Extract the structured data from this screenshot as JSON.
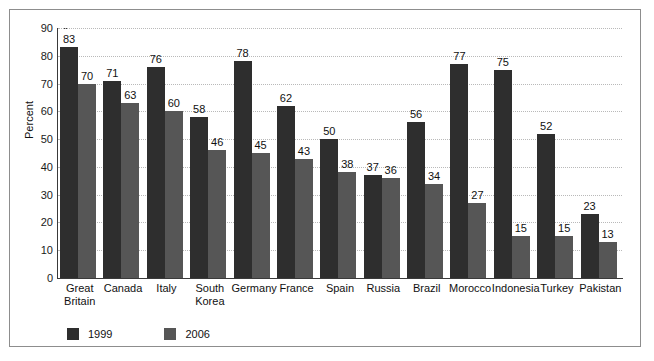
{
  "chart_data": {
    "type": "bar",
    "title": "",
    "xlabel": "",
    "ylabel": "Percent",
    "ylim": [
      0,
      90
    ],
    "ytick_step": 10,
    "yticks": [
      90,
      80,
      70,
      60,
      50,
      40,
      30,
      20,
      10,
      0
    ],
    "grid": true,
    "legend_position": "bottom-left",
    "categories": [
      "Great\nBritain",
      "Canada",
      "Italy",
      "South\nKorea",
      "Germany",
      "France",
      "Spain",
      "Russia",
      "Brazil",
      "Morocco",
      "Indonesia",
      "Turkey",
      "Pakistan"
    ],
    "series": [
      {
        "name": "1999",
        "color": "#2e2e2e",
        "values": [
          83,
          71,
          76,
          58,
          78,
          62,
          50,
          37,
          56,
          77,
          75,
          52,
          23
        ]
      },
      {
        "name": "2006",
        "color": "#565656",
        "values": [
          70,
          63,
          60,
          46,
          45,
          43,
          38,
          36,
          34,
          27,
          15,
          15,
          13
        ]
      }
    ]
  },
  "legend": {
    "items": [
      {
        "label": "1999",
        "color": "#2e2e2e"
      },
      {
        "label": "2006",
        "color": "#565656"
      }
    ]
  },
  "colors": {
    "series_1999": "#2e2e2e",
    "series_2006": "#565656",
    "gridline": "#b9b9b9",
    "axis": "#3a3a3a",
    "frame": "#8d8d8d"
  }
}
